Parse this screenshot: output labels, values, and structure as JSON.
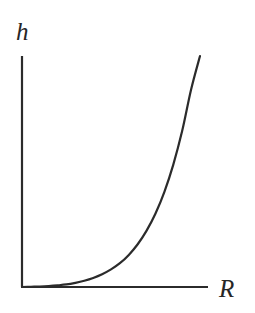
{
  "figure": {
    "background_color": "#ffffff",
    "ink_color": "#2b2b2b",
    "width": 255,
    "height": 313
  },
  "chart_data": {
    "type": "line",
    "title": "",
    "subtitle": "",
    "xlabel": "R",
    "ylabel": "h",
    "xlabel_style": "italic-math",
    "ylabel_style": "italic-math",
    "grid": false,
    "legend": null,
    "legend_position": "none",
    "axis_ticks": false,
    "tick_labels": [],
    "annotations": [],
    "xlim": [
      0,
      1
    ],
    "ylim": [
      0,
      1
    ],
    "series": [
      {
        "name": "h(R)",
        "color": "#2b2b2b",
        "line_width": 2.2,
        "x": [
          0.0,
          0.05,
          0.1,
          0.15,
          0.2,
          0.25,
          0.3,
          0.35,
          0.4,
          0.45,
          0.5,
          0.55,
          0.6,
          0.65,
          0.7,
          0.75,
          0.8,
          0.85,
          0.9,
          0.95,
          1.0
        ],
        "y": [
          0.0,
          0.001,
          0.002,
          0.004,
          0.007,
          0.011,
          0.018,
          0.027,
          0.039,
          0.055,
          0.076,
          0.103,
          0.139,
          0.185,
          0.244,
          0.318,
          0.412,
          0.53,
          0.676,
          0.855,
          1.0
        ]
      }
    ]
  },
  "axes": {
    "origin_px": {
      "x": 22,
      "y": 287
    },
    "y_axis": {
      "x": 22,
      "y_top": 56,
      "y_bottom": 287
    },
    "x_axis": {
      "y": 287,
      "x_left": 22,
      "x_right": 208
    },
    "curve_end_px": {
      "x": 200,
      "y": 56
    },
    "line_width": 2.2
  },
  "labels": {
    "y": "h",
    "x": "R"
  }
}
